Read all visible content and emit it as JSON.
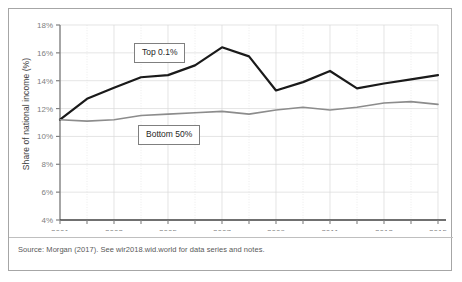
{
  "figure": {
    "source_note": "Source:  Morgan (2017). See wir2018.wid.world for data series and notes.",
    "callout_top_label": "Top 0.1%",
    "callout_bottom_label": "Bottom 50%",
    "colors": {
      "top_series": "#1a1a1a",
      "bottom_series": "#8c8c8c",
      "axis": "#808080",
      "grid": "#d9d9d9",
      "frame_border": "#a6a6a6",
      "background": "#ffffff"
    }
  },
  "chart_data": {
    "type": "line",
    "title": "",
    "xlabel": "",
    "ylabel": "Share of national income (%)",
    "x": [
      2001,
      2002,
      2003,
      2004,
      2005,
      2006,
      2007,
      2008,
      2009,
      2010,
      2011,
      2012,
      2013,
      2014,
      2015
    ],
    "xtick_labels": [
      "2001",
      "",
      "2003",
      "",
      "2005",
      "",
      "2007",
      "",
      "2009",
      "",
      "2011",
      "",
      "2013",
      "",
      "2015"
    ],
    "xlim": [
      2001,
      2015
    ],
    "ylim": [
      4,
      18
    ],
    "ytick_values": [
      4,
      6,
      8,
      10,
      12,
      14,
      16,
      18
    ],
    "ytick_labels": [
      "4%",
      "6%",
      "8%",
      "10%",
      "12%",
      "14%",
      "16%",
      "18%"
    ],
    "grid": true,
    "legend": "inline-callout-labels",
    "series": [
      {
        "name": "Top 0.1%",
        "color": "#1a1a1a",
        "width": 2.2,
        "values": [
          11.2,
          12.7,
          13.5,
          14.25,
          14.4,
          15.1,
          16.4,
          15.75,
          13.3,
          13.9,
          14.7,
          13.45,
          13.8,
          14.1,
          14.4
        ]
      },
      {
        "name": "Bottom 50%",
        "color": "#8c8c8c",
        "width": 1.6,
        "values": [
          11.2,
          11.1,
          11.2,
          11.5,
          11.6,
          11.7,
          11.8,
          11.6,
          11.9,
          12.1,
          11.9,
          12.1,
          12.4,
          12.5,
          12.3
        ]
      }
    ]
  }
}
